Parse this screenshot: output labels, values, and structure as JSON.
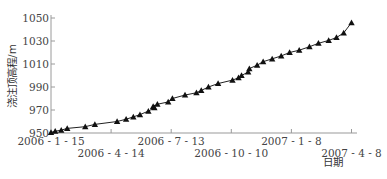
{
  "chart_data": {
    "type": "line",
    "title": "",
    "xlabel": "日期",
    "ylabel": "浇注顶高程/m",
    "ylim": [
      950,
      1050
    ],
    "yticks": [
      950,
      970,
      990,
      1010,
      1030,
      1050
    ],
    "xticks": [
      {
        "label": "2006 - 1 - 15",
        "pos": 0,
        "row": 0
      },
      {
        "label": "2006 - 4 - 14",
        "pos": 1,
        "row": 1
      },
      {
        "label": "2006 - 7 - 13",
        "pos": 2,
        "row": 0
      },
      {
        "label": "2006 - 10 - 10",
        "pos": 3,
        "row": 1
      },
      {
        "label": "2007 - 1 - 8",
        "pos": 4,
        "row": 0
      },
      {
        "label": "2007 - 4 - 8",
        "pos": 5,
        "row": 1
      }
    ],
    "grid": false,
    "legend": null,
    "marker": "triangle",
    "series": [
      {
        "name": "浇注顶高程",
        "x": [
          0.0,
          0.07,
          0.17,
          0.27,
          0.57,
          0.73,
          1.1,
          1.25,
          1.37,
          1.48,
          1.62,
          1.72,
          1.7,
          1.77,
          1.95,
          2.02,
          2.23,
          2.42,
          2.5,
          2.62,
          2.78,
          3.02,
          3.12,
          3.17,
          3.28,
          3.3,
          3.43,
          3.53,
          3.68,
          3.83,
          3.97,
          4.13,
          4.3,
          4.45,
          4.62,
          4.75,
          4.87,
          5.0
        ],
        "values": [
          950.5,
          951.5,
          952.5,
          954,
          955.5,
          957.5,
          960,
          962,
          964,
          966,
          969,
          972,
          973,
          975,
          977,
          980,
          983,
          985,
          987,
          990,
          993,
          996,
          998,
          1000,
          1003,
          1006,
          1009,
          1012,
          1014.5,
          1017,
          1020,
          1022,
          1025,
          1028,
          1030.5,
          1033,
          1037,
          1046
        ]
      }
    ]
  }
}
